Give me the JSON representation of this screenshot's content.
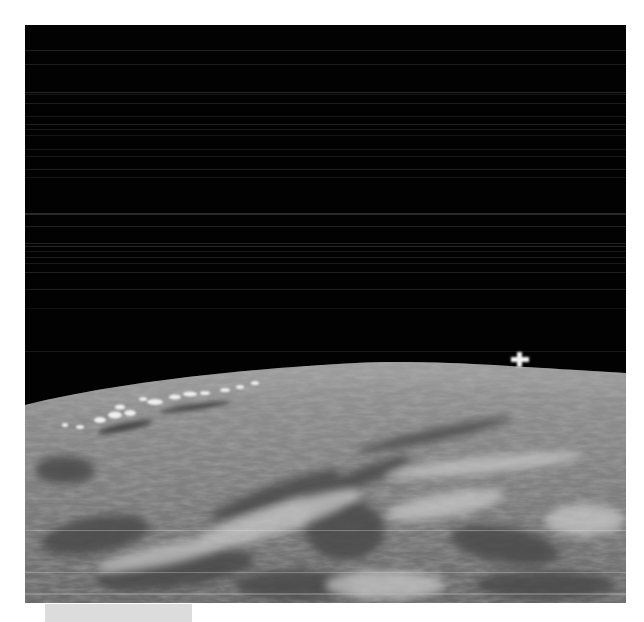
{
  "image": {
    "subject": "Earth horizon from orbit with a small satellite above the limb",
    "colors": {
      "page_background": "#ffffff",
      "space": "#020202",
      "scanline": "#2a2a2a",
      "earth_light": "#b8b8b8",
      "earth_mid": "#8a8a8a",
      "earth_dark": "#4a4a4a",
      "satellite": "#f2f2f2",
      "caption_block": "#dcdcdc"
    },
    "elements": {
      "satellite": {
        "label": "",
        "x": 520,
        "y": 360
      },
      "caption_block": {
        "label": ""
      }
    }
  }
}
